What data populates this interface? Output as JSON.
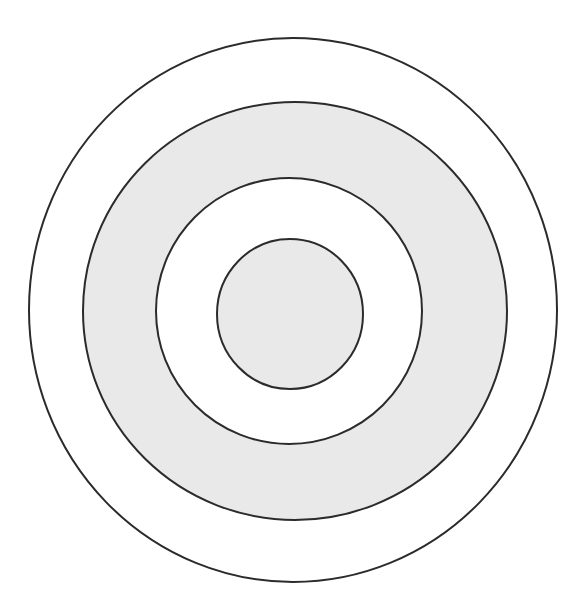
{
  "figure": {
    "type": "concentric-circles",
    "background_color": "#ffffff",
    "canvas": {
      "width": 584,
      "height": 616
    },
    "center": {
      "x": 293,
      "y": 310
    },
    "stroke_color": "#2b2b2b",
    "stroke_width": 2,
    "fill_gray": "#e9e9e9",
    "fill_white": "#ffffff",
    "rings": [
      {
        "name": "ring-1-outermost",
        "index": 1,
        "radius_x": 264,
        "radius_y": 272,
        "fill": "#ffffff",
        "fill_name": "white",
        "stroke": "#2b2b2b",
        "stroke_width": 2
      },
      {
        "name": "ring-2",
        "index": 2,
        "radius_x": 212,
        "radius_y": 209,
        "fill": "#e9e9e9",
        "fill_name": "gray",
        "stroke": "#2b2b2b",
        "stroke_width": 2
      },
      {
        "name": "ring-3",
        "index": 3,
        "radius_x": 133,
        "radius_y": 133,
        "fill": "#ffffff",
        "fill_name": "white",
        "stroke": "#2b2b2b",
        "stroke_width": 2
      },
      {
        "name": "ring-4-innermost",
        "index": 4,
        "radius_x": 73,
        "radius_y": 75,
        "fill": "#e9e9e9",
        "fill_name": "gray",
        "stroke": "#2b2b2b",
        "stroke_width": 2
      }
    ],
    "bands": [
      {
        "name": "band-outer-white",
        "fill_name": "white"
      },
      {
        "name": "band-gray-ring",
        "fill_name": "gray"
      },
      {
        "name": "band-inner-white",
        "fill_name": "white"
      },
      {
        "name": "band-core-gray",
        "fill_name": "gray"
      }
    ]
  }
}
